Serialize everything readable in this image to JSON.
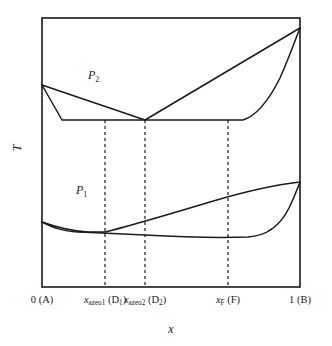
{
  "figure": {
    "kind": "phase-diagram",
    "background_color": "#ffffff",
    "line_color": "#1a1a1a",
    "guide_color": "#2b2b2b"
  },
  "axes": {
    "x_title": "x",
    "y_title": "T",
    "frame": {
      "left": 42,
      "top": 18,
      "right": 300,
      "bottom": 287
    },
    "x_range": [
      0,
      1
    ],
    "grid": false
  },
  "ticks": [
    {
      "name": "pure-a",
      "value": 0.0,
      "px": 42,
      "text_html": "0 (A)"
    },
    {
      "name": "azeotrope-1",
      "value": 0.245,
      "px": 105,
      "text_html": "<span class=\"it\">x</span><sub>azeo1</sub> (D<sub>1</sub>)"
    },
    {
      "name": "azeotrope-2",
      "value": 0.399,
      "px": 145,
      "text_html": "<span class=\"it\">x</span><sub>azeo2</sub> (D<sub>2</sub>)"
    },
    {
      "name": "feed",
      "value": 0.721,
      "px": 228,
      "text_html": "<span class=\"it\">x</span><sub>F</sub> (F)"
    },
    {
      "name": "pure-b",
      "value": 1.0,
      "px": 300,
      "text_html": "1 (B)"
    }
  ],
  "guide_lines": [
    {
      "name": "guide-azeo1",
      "px": 105,
      "y_top": 120,
      "y_bottom": 287
    },
    {
      "name": "guide-azeo2",
      "px": 145,
      "y_top": 120,
      "y_bottom": 287
    },
    {
      "name": "guide-feed",
      "px": 228,
      "y_top": 120,
      "y_bottom": 287
    }
  ],
  "curve_labels": [
    {
      "name": "pressure-2-label",
      "text_html": "<span>P</span><sub>2</sub>",
      "x": 88,
      "y": 69
    },
    {
      "name": "pressure-1-label",
      "text_html": "<span>P</span><sub>1</sub>",
      "x": 76,
      "y": 184
    }
  ],
  "chart_data": {
    "type": "line",
    "title": "",
    "xlabel": "x",
    "ylabel": "T",
    "xlim": [
      0,
      1
    ],
    "note": "Higher curve pair is isobar P2, lower pair is isobar P1; each pair is a dew line and a bubble line meeting at two azeotropes",
    "series": [
      {
        "name": "P2 dew line left branch",
        "isobar": "P2",
        "branch": "dew",
        "path_px": [
          [
            42,
            85
          ],
          [
            62,
            120
          ],
          [
            145,
            120
          ],
          [
            243,
            120
          ],
          [
            256,
            112
          ],
          [
            272,
            90
          ],
          [
            288,
            58
          ],
          [
            297,
            33
          ],
          [
            300,
            28
          ]
        ]
      },
      {
        "name": "P2 bubble line",
        "isobar": "P2",
        "branch": "bubble",
        "path_px": [
          [
            42,
            85
          ],
          [
            96,
            105
          ],
          [
            145,
            120
          ],
          [
            200,
            92
          ],
          [
            255,
            63
          ],
          [
            300,
            28
          ]
        ]
      },
      {
        "name": "P1 upper branch",
        "isobar": "P1",
        "branch": "dew",
        "path_px": [
          [
            42,
            222
          ],
          [
            70,
            229
          ],
          [
            105,
            232
          ],
          [
            145,
            235
          ],
          [
            200,
            237
          ],
          [
            240,
            238
          ],
          [
            262,
            236
          ],
          [
            278,
            226
          ],
          [
            290,
            206
          ],
          [
            297,
            190
          ],
          [
            300,
            182
          ]
        ]
      },
      {
        "name": "P1 lower branch",
        "isobar": "P1",
        "branch": "bubble",
        "path_px": [
          [
            42,
            222
          ],
          [
            75,
            228
          ],
          [
            105,
            232
          ],
          [
            150,
            222
          ],
          [
            200,
            208
          ],
          [
            250,
            194
          ],
          [
            300,
            182
          ]
        ]
      }
    ]
  }
}
